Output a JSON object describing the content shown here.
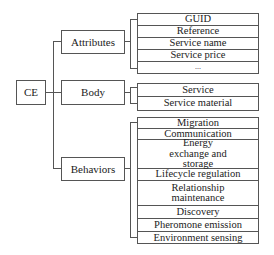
{
  "root": {
    "label": "CE"
  },
  "branches": [
    {
      "label": "Attributes",
      "items": [
        "GUID",
        "Reference",
        "Service name",
        "Service price",
        "..."
      ]
    },
    {
      "label": "Body",
      "items": [
        "Service",
        "Service material"
      ]
    },
    {
      "label": "Behaviors",
      "items": [
        "Migration",
        "Communication",
        "Energy exchange and storage",
        "Lifecycle regulation",
        "Relationship maintenance",
        "Discovery",
        "Pheromone emission",
        "Environment sensing"
      ]
    }
  ]
}
